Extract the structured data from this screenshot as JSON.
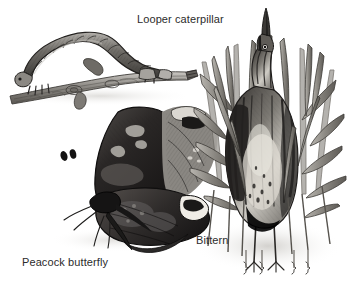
{
  "page": {
    "background_color": "#ffffff",
    "media_type": "scanned grayscale engraving plate",
    "width": 356,
    "height": 285
  },
  "figures": [
    {
      "id": "looper-caterpillar",
      "caption": "Looper caterpillar",
      "caption_position": {
        "x": 137,
        "y": 13
      },
      "description": "Geometrid looper caterpillar arched in a loop, gripping and mimicking a woody twig",
      "bounds": {
        "x": 8,
        "y": 22,
        "width": 190,
        "height": 82
      },
      "ink_colors": [
        "#1c1c1c",
        "#4a4a4a",
        "#7b7b7b",
        "#a9a9a9",
        "#d4d4d4"
      ]
    },
    {
      "id": "peacock-butterfly",
      "caption": "Peacock butterfly",
      "caption_position": {
        "x": 22,
        "y": 256
      },
      "description": "Peacock butterfly perched with dark mottled wings resembling a dead leaf, two clubbed antennae raised",
      "bounds": {
        "x": 28,
        "y": 106,
        "width": 158,
        "height": 148
      },
      "ink_colors": [
        "#111111",
        "#333333",
        "#5d5d5d",
        "#8e8e8e",
        "#c2c2c2"
      ]
    },
    {
      "id": "bittern",
      "caption": "Bittern",
      "caption_position": {
        "x": 196,
        "y": 234
      },
      "description": "Bittern standing upright with bill pointed skyward, striped plumage blending into vertical reeds",
      "bounds": {
        "x": 190,
        "y": 34,
        "width": 164,
        "height": 246
      },
      "ink_colors": [
        "#141414",
        "#3c3c3c",
        "#6e6e6e",
        "#9c9c9c",
        "#cfcfcf"
      ]
    }
  ],
  "captions": {
    "looper": "Looper caterpillar",
    "peacock": "Peacock butterfly",
    "bittern": "Bittern"
  }
}
